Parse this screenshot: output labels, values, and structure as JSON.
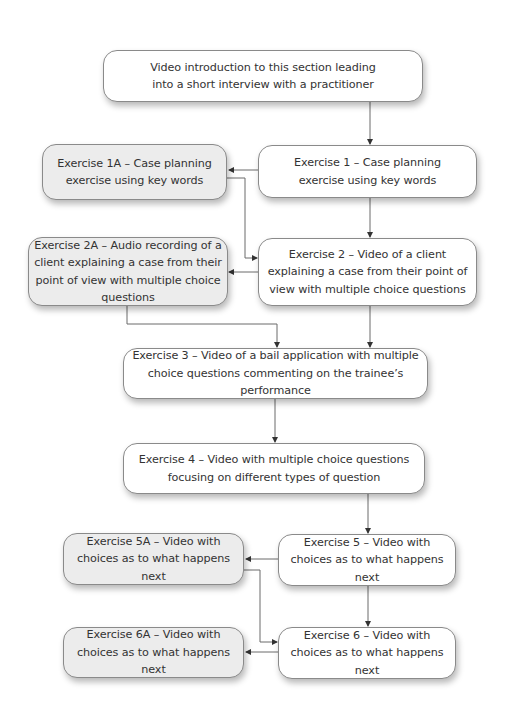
{
  "diagram": {
    "type": "flowchart",
    "colors": {
      "primary_fill": "#ffffff",
      "alternative_fill": "#ececec",
      "border": "#8a8a8a",
      "connector": "#6a6a6a",
      "text": "#333333"
    },
    "nodes": {
      "intro": {
        "label": "Video introduction to this section leading into a short interview with a practitioner",
        "style": "primary"
      },
      "ex1": {
        "label": "Exercise 1 – Case planning exercise using key words",
        "style": "primary"
      },
      "ex1a": {
        "label": "Exercise 1A – Case planning exercise using key words",
        "style": "alternative"
      },
      "ex2": {
        "label": "Exercise 2 – Video of a client explaining a case from their point of view with multiple choice questions",
        "style": "primary"
      },
      "ex2a": {
        "label": "Exercise 2A – Audio recording of a client explaining a case from their point of view with multiple choice questions",
        "style": "alternative"
      },
      "ex3": {
        "label": "Exercise 3 – Video of a bail application with multiple choice questions commenting on the trainee’s performance",
        "style": "primary"
      },
      "ex4": {
        "label": "Exercise 4 – Video with multiple choice questions focusing on different types of question",
        "style": "primary"
      },
      "ex5": {
        "label": "Exercise 5 – Video with choices as to what happens next",
        "style": "primary"
      },
      "ex5a": {
        "label": "Exercise 5A – Video with choices as to what happens next",
        "style": "alternative"
      },
      "ex6": {
        "label": "Exercise 6 – Video with choices as to what happens next",
        "style": "primary"
      },
      "ex6a": {
        "label": "Exercise 6A – Video with choices as to what happens next",
        "style": "alternative"
      }
    },
    "edges": [
      {
        "from": "intro",
        "to": "ex1"
      },
      {
        "from": "ex1",
        "to": "ex1a"
      },
      {
        "from": "ex1",
        "to": "ex2"
      },
      {
        "from": "ex1a",
        "to": "ex2"
      },
      {
        "from": "ex2",
        "to": "ex2a"
      },
      {
        "from": "ex2",
        "to": "ex3"
      },
      {
        "from": "ex2a",
        "to": "ex3"
      },
      {
        "from": "ex3",
        "to": "ex4"
      },
      {
        "from": "ex4",
        "to": "ex5"
      },
      {
        "from": "ex5",
        "to": "ex5a"
      },
      {
        "from": "ex5",
        "to": "ex6"
      },
      {
        "from": "ex5a",
        "to": "ex6"
      },
      {
        "from": "ex6",
        "to": "ex6a"
      }
    ]
  }
}
